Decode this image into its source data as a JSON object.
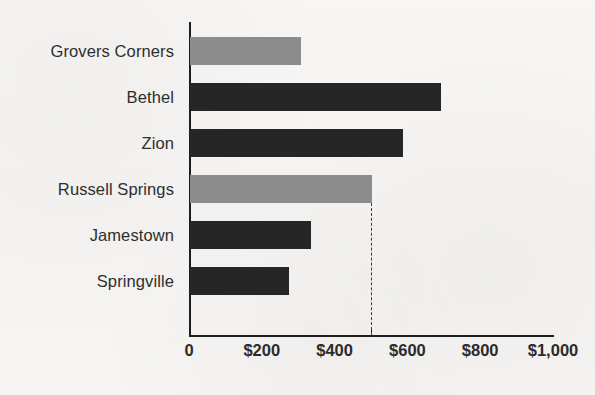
{
  "chart_data": {
    "type": "bar",
    "orientation": "horizontal",
    "title": "",
    "subtitle": "",
    "xlabel": "",
    "ylabel": "",
    "categories": [
      "Grovers Corners",
      "Bethel",
      "Zion",
      "Russell Springs",
      "Jamestown",
      "Springville"
    ],
    "values": [
      305,
      690,
      585,
      500,
      332,
      272
    ],
    "bar_colors": [
      "#8c8c8c",
      "#262626",
      "#262626",
      "#8c8c8c",
      "#262626",
      "#262626"
    ],
    "xlim": [
      0,
      1000
    ],
    "ylim": [
      0,
      6
    ],
    "xticks": [
      0,
      200,
      400,
      600,
      800,
      1000
    ],
    "xtick_labels": [
      "0",
      "$200",
      "$400",
      "$600",
      "$800",
      "$1,000"
    ],
    "ytick_labels": [
      "Grovers Corners",
      "Bethel",
      "Zion",
      "Russell Springs",
      "Jamestown",
      "Springville"
    ],
    "grid": false,
    "legend": false,
    "legend_position": "none",
    "annotations": [
      {
        "type": "reference-line",
        "style": "dashed",
        "orientation": "vertical",
        "value": 500,
        "label": "",
        "color": "#3a3a3a"
      }
    ],
    "series": [
      {
        "name": "Amount",
        "values": [
          305,
          690,
          585,
          500,
          332,
          272
        ]
      }
    ]
  },
  "colors": {
    "background": "#f6f5f3",
    "axis": "#1d1d1d",
    "bar_dark": "#262626",
    "bar_light": "#8c8c8c",
    "reference_line": "#3a3a3a",
    "text": "#2b2b2b"
  }
}
